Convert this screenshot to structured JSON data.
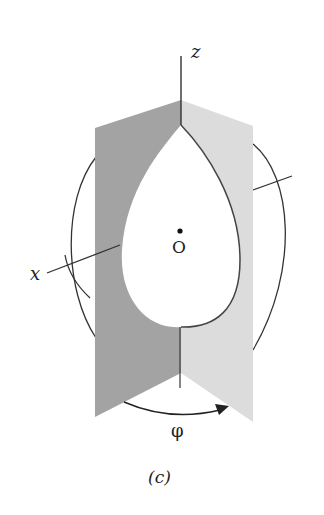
{
  "figure": {
    "caption": "(c)",
    "labels": {
      "z_axis": "z",
      "x_axis": "x",
      "origin": "O",
      "angle": "φ"
    },
    "colors": {
      "background": "#ffffff",
      "left_plane": "#a3a3a3",
      "right_plane": "#dcdcdc",
      "lines": "#333333",
      "cutout": "#ffffff"
    }
  }
}
